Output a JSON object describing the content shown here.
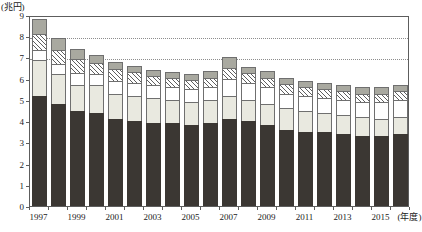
{
  "axis": {
    "y_unit_label": "(兆円)",
    "x_unit_label": "(年度)",
    "y_ticks": [
      "0",
      "1",
      "2",
      "3",
      "4",
      "5",
      "6",
      "7",
      "8",
      "9"
    ],
    "x_tick_labels": [
      "1997",
      "1999",
      "2001",
      "2003",
      "2005",
      "2007",
      "2009",
      "2011",
      "2013",
      "2015"
    ]
  },
  "colors": {
    "segment_1": "#3b3733",
    "segment_2": "#e9e9e0",
    "segment_3": "#ffffff",
    "segment_4": "#ffffff",
    "segment_5": "#a9a9a0",
    "axis": "#5d5d5d",
    "grid": "#8d8d8d"
  },
  "chart_data": {
    "type": "bar",
    "title": "",
    "xlabel": "(年度)",
    "ylabel": "(兆円)",
    "ylim": [
      0,
      9
    ],
    "yticks": [
      0,
      1,
      2,
      3,
      4,
      5,
      6,
      7,
      8,
      9
    ],
    "grid": true,
    "gridlines_at": [
      7,
      8
    ],
    "stacked": true,
    "legend": "none",
    "categories": [
      "1997",
      "1998",
      "1999",
      "2000",
      "2001",
      "2002",
      "2003",
      "2004",
      "2005",
      "2006",
      "2007",
      "2008",
      "2009",
      "2010",
      "2011",
      "2012",
      "2013",
      "2014",
      "2015",
      "2016"
    ],
    "series": [
      {
        "name": "segment-1-dark",
        "values": [
          5.2,
          4.8,
          4.5,
          4.4,
          4.1,
          4.0,
          3.9,
          3.9,
          3.8,
          3.9,
          4.1,
          4.0,
          3.8,
          3.6,
          3.5,
          3.5,
          3.4,
          3.3,
          3.3,
          3.4
        ]
      },
      {
        "name": "segment-2-light-gray",
        "values": [
          1.7,
          1.4,
          1.2,
          1.3,
          1.2,
          1.2,
          1.2,
          1.1,
          1.1,
          1.1,
          1.1,
          1.0,
          1.0,
          1.0,
          1.0,
          0.9,
          0.9,
          0.9,
          0.8,
          0.8
        ]
      },
      {
        "name": "segment-3-white",
        "values": [
          0.45,
          0.5,
          0.55,
          0.5,
          0.6,
          0.6,
          0.6,
          0.6,
          0.6,
          0.6,
          0.8,
          0.8,
          0.8,
          0.7,
          0.7,
          0.7,
          0.7,
          0.7,
          0.8,
          0.8
        ]
      },
      {
        "name": "segment-4-hatched",
        "values": [
          0.75,
          0.65,
          0.7,
          0.55,
          0.55,
          0.5,
          0.45,
          0.45,
          0.45,
          0.45,
          0.5,
          0.45,
          0.45,
          0.45,
          0.4,
          0.4,
          0.4,
          0.4,
          0.4,
          0.4
        ]
      },
      {
        "name": "segment-5-gray",
        "values": [
          0.7,
          0.55,
          0.45,
          0.35,
          0.35,
          0.3,
          0.25,
          0.25,
          0.25,
          0.3,
          0.5,
          0.3,
          0.3,
          0.3,
          0.3,
          0.3,
          0.3,
          0.3,
          0.3,
          0.3
        ]
      }
    ],
    "totals": [
      8.8,
      7.9,
      7.4,
      7.1,
      6.8,
      6.6,
      6.4,
      6.3,
      6.2,
      6.35,
      7.0,
      6.55,
      6.35,
      6.05,
      5.9,
      5.8,
      5.7,
      5.6,
      5.6,
      5.7
    ]
  }
}
